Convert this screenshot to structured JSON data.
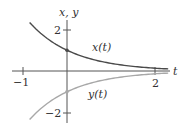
{
  "chart_data": {
    "type": "line",
    "title": "",
    "xlabel": "t",
    "ylabel": "x, y",
    "xlim": [
      -1.0,
      2.6
    ],
    "ylim": [
      -2.6,
      2.6
    ],
    "x_ticks": [
      {
        "value": -1,
        "label": "−1"
      },
      {
        "value": 2,
        "label": "2"
      }
    ],
    "y_ticks": [
      {
        "value": 2,
        "label": "2"
      },
      {
        "value": -2,
        "label": "−2"
      }
    ],
    "grid": false,
    "legend": "none (inline curve labels)",
    "series": [
      {
        "name": "x(t)",
        "label": "x(t)",
        "color": "#4a4a4a",
        "formula": "e^(-t)",
        "x": [
          -0.85,
          -0.5,
          0,
          0.5,
          1,
          1.5,
          2,
          2.3
        ],
        "values": [
          2.34,
          1.65,
          1.0,
          0.61,
          0.37,
          0.22,
          0.14,
          0.1
        ]
      },
      {
        "name": "y(t)",
        "label": "y(t)",
        "color": "#a8a8a8",
        "formula": "-e^(-t)",
        "x": [
          -0.85,
          -0.5,
          0,
          0.5,
          1,
          1.5,
          2,
          2.3
        ],
        "values": [
          -2.34,
          -1.65,
          -1.0,
          -0.61,
          -0.37,
          -0.22,
          -0.14,
          -0.1
        ]
      }
    ],
    "annotations": [
      {
        "text": "x(t)",
        "near": "upper curve"
      },
      {
        "text": "y(t)",
        "near": "lower curve"
      }
    ]
  },
  "labels": {
    "y_axis": "x, y",
    "x_axis": "t",
    "tick_x_neg1": "−1",
    "tick_x_2": "2",
    "tick_y_2": "2",
    "tick_y_neg2": "−2",
    "curve_x": "x(t)",
    "curve_y": "y(t)"
  }
}
